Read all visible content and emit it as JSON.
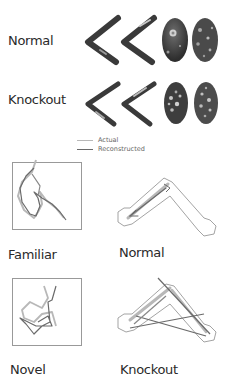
{
  "top_section": {
    "rows": [
      {
        "label": "Normal"
      },
      {
        "label": "Knockout"
      }
    ]
  },
  "legend": {
    "items": [
      {
        "label": "Actual",
        "color": "#b8b8b8"
      },
      {
        "label": "Reconstructed",
        "color": "#6a6a6a"
      }
    ]
  },
  "bottom_section": {
    "panels": [
      {
        "label": "Familiar"
      },
      {
        "label": "Normal"
      },
      {
        "label": "Novel"
      },
      {
        "label": "Knockout"
      }
    ]
  },
  "colors": {
    "dark_map": "#3a3a3a",
    "mid_map": "#6e6e6e",
    "light_highlight": "#d8d8d8",
    "actual_path": "#b8b8b8",
    "reconstructed_path": "#6a6a6a",
    "outline": "#9a9a9a"
  }
}
